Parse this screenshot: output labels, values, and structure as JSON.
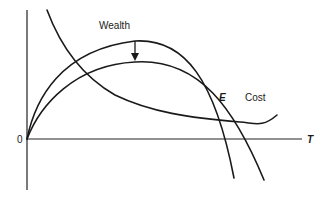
{
  "diagram": {
    "labels": {
      "wealth": "Wealth",
      "cost": "Cost",
      "equilibrium": "E",
      "origin": "0",
      "x_axis": "T"
    },
    "curves": [
      {
        "name": "Cost",
        "shape": "decreasing, flattens then dips"
      },
      {
        "name": "Wealth (upper)",
        "shape": "inverted-U from origin"
      },
      {
        "name": "Wealth (lower)",
        "shape": "inverted-U from origin, shifted down/right"
      }
    ],
    "arrow": {
      "from": "upper wealth peak",
      "to": "lower wealth peak",
      "direction": "down"
    },
    "colors": {
      "stroke": "#1a1a1a",
      "background": "#ffffff"
    }
  }
}
